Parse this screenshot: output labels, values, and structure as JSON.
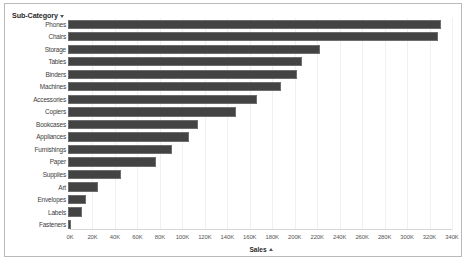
{
  "header": {
    "field_label": "Sub-Category",
    "sort_icon": "sort-descending-caret-icon"
  },
  "axis": {
    "x_title": "Sales",
    "x_sort_icon": "sort-ascending-caret-icon",
    "ticks": [
      "0K",
      "20K",
      "40K",
      "60K",
      "80K",
      "100K",
      "120K",
      "140K",
      "160K",
      "180K",
      "200K",
      "220K",
      "240K",
      "260K",
      "280K",
      "300K",
      "320K",
      "340K"
    ]
  },
  "colors": {
    "bar": "#434343",
    "bar_border": "#6e6e6e",
    "panel_border": "#b9b9b9",
    "gridline": "#f0f0f0",
    "background": "#ffffff"
  },
  "chart_data": {
    "type": "bar",
    "orientation": "horizontal",
    "title": "",
    "xlabel": "Sales",
    "ylabel": "Sub-Category",
    "xlim": [
      0,
      340000
    ],
    "grid": true,
    "legend": "none",
    "categories": [
      "Phones",
      "Chairs",
      "Storage",
      "Tables",
      "Binders",
      "Machines",
      "Accessories",
      "Copiers",
      "Bookcases",
      "Appliances",
      "Furnishings",
      "Paper",
      "Supplies",
      "Art",
      "Envelopes",
      "Labels",
      "Fasteners"
    ],
    "values": [
      330000,
      328000,
      223000,
      207000,
      203000,
      189000,
      167000,
      149000,
      115000,
      107000,
      92000,
      78000,
      47000,
      27000,
      16000,
      12000,
      3000
    ],
    "tick_values": [
      0,
      20000,
      40000,
      60000,
      80000,
      100000,
      120000,
      140000,
      160000,
      180000,
      200000,
      220000,
      240000,
      260000,
      280000,
      300000,
      320000,
      340000
    ],
    "tick_labels": [
      "0K",
      "20K",
      "40K",
      "60K",
      "80K",
      "100K",
      "120K",
      "140K",
      "160K",
      "180K",
      "200K",
      "220K",
      "240K",
      "260K",
      "280K",
      "300K",
      "320K",
      "340K"
    ]
  }
}
